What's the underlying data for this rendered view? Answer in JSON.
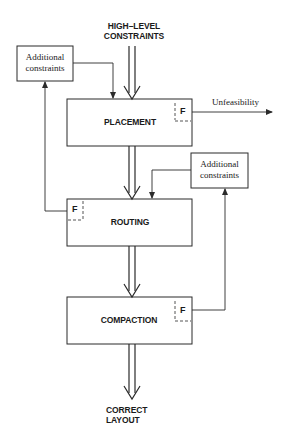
{
  "diagram": {
    "input": {
      "line1": "HIGH–LEVEL",
      "line2": "CONSTRAINTS"
    },
    "output": {
      "line1": "CORRECT",
      "line2": "LAYOUT"
    },
    "stages": [
      {
        "id": "placement",
        "label": "PLACEMENT",
        "flag": "F"
      },
      {
        "id": "routing",
        "label": "ROUTING",
        "flag": "F"
      },
      {
        "id": "compaction",
        "label": "COMPACTION",
        "flag": "F"
      }
    ],
    "side_boxes": [
      {
        "id": "left",
        "line1": "Additional",
        "line2": "constraints"
      },
      {
        "id": "right",
        "line1": "Additional",
        "line2": "constraints"
      }
    ],
    "unfeasibility_label": "Unfeasibility",
    "colors": {
      "stroke": "#2a2a2a",
      "background": "#ffffff"
    }
  }
}
